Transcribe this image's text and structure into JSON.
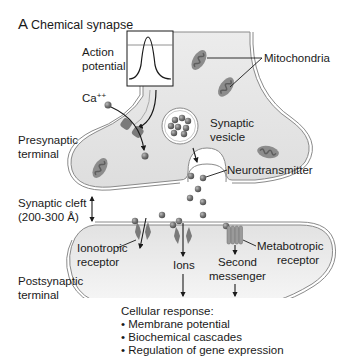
{
  "figure": {
    "panel_letter": "A",
    "title": "Chemical synapse",
    "colors": {
      "cytoplasm": "#e6e6e6",
      "membrane": "#8a8a8a",
      "axon_gradient_light": "#f4f4f4",
      "mitochondria": "#8c8c8c",
      "mitochondria_dark": "#5e5e5e",
      "vesicle_ball": "#6d6d6d",
      "receptor": "#7a7a7a",
      "text": "#1a1a1a"
    }
  },
  "labels": {
    "action_potential_line1": "Action",
    "action_potential_line2": "potential",
    "mitochondria": "Mitochondria",
    "calcium": "Ca",
    "calcium_sup": "++",
    "presynaptic_line1": "Presynaptic",
    "presynaptic_line2": "terminal",
    "synaptic_vesicle_line1": "Synaptic",
    "synaptic_vesicle_line2": "vesicle",
    "neurotransmitter": "Neurotransmitter",
    "synaptic_cleft_line1": "Synaptic cleft",
    "synaptic_cleft_line2": "(200-300 Å)",
    "ionotropic_line1": "Ionotropic",
    "ionotropic_line2": "receptor",
    "metabotropic_line1": "Metabotropic",
    "metabotropic_line2": "receptor",
    "ions": "Ions",
    "second_messenger_line1": "Second",
    "second_messenger_line2": "messenger",
    "postsynaptic_line1": "Postsynaptic",
    "postsynaptic_line2": "terminal"
  },
  "cellular_response": {
    "heading": "Cellular response:",
    "items": [
      "• Membrane potential",
      "• Biochemical cascades",
      "• Regulation of gene expression"
    ]
  }
}
